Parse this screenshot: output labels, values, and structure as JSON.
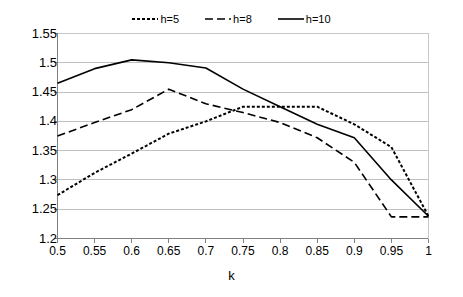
{
  "chart_data": {
    "type": "line",
    "title": "",
    "xlabel": "k",
    "ylabel": "",
    "x": [
      0.5,
      0.55,
      0.6,
      0.65,
      0.7,
      0.75,
      0.8,
      0.85,
      0.9,
      0.95,
      1
    ],
    "categories": [
      "0.5",
      "0.55",
      "0.6",
      "0.65",
      "0.7",
      "0.75",
      "0.8",
      "0.85",
      "0.9",
      "0.95",
      "1"
    ],
    "xtick_labels": [
      "0.5",
      "0.55",
      "0.6",
      "0.65",
      "0.7",
      "0.75",
      "0.8",
      "0.85",
      "0.9",
      "0.95",
      "1"
    ],
    "ytick_labels": [
      "1.55",
      "1.5",
      "1.45",
      "1.4",
      "1.35",
      "1.3",
      "1.25",
      "1.2"
    ],
    "yticks": [
      1.55,
      1.5,
      1.45,
      1.4,
      1.35,
      1.3,
      1.25,
      1.2
    ],
    "ylim": [
      1.2,
      1.55
    ],
    "xlim": [
      0.5,
      1
    ],
    "grid": "horizontal",
    "grid_color": "#c0c0c0",
    "axis_color": "#808080",
    "legend_position": "top-center",
    "series": [
      {
        "name": "h=5",
        "label": "h=5",
        "style": "dotted",
        "dash": "3,2",
        "width": 2,
        "color": "#000000",
        "values": [
          1.274,
          1.312,
          1.345,
          1.379,
          1.4,
          1.425,
          1.425,
          1.425,
          1.395,
          1.356,
          1.238
        ]
      },
      {
        "name": "h=8",
        "label": "h=8",
        "style": "dashed",
        "dash": "8,4",
        "width": 1.6,
        "color": "#000000",
        "values": [
          1.375,
          1.398,
          1.42,
          1.455,
          1.43,
          1.415,
          1.398,
          1.372,
          1.33,
          1.237,
          1.237
        ]
      },
      {
        "name": "h=10",
        "label": "h=10",
        "style": "solid",
        "dash": "none",
        "width": 1.6,
        "color": "#000000",
        "values": [
          1.465,
          1.49,
          1.505,
          1.5,
          1.491,
          1.455,
          1.425,
          1.395,
          1.372,
          1.3,
          1.238
        ]
      }
    ]
  }
}
